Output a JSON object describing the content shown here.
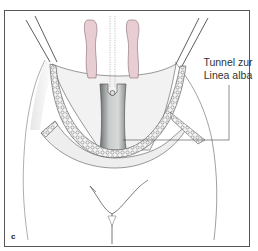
{
  "figure": {
    "panel_letter": "c",
    "callout": {
      "line1": "Tunnel zur",
      "line2": "Linea alba"
    }
  },
  "colors": {
    "frame": "#555555",
    "muscle_pink": "#e8cdd3",
    "muscle_outline": "#8a6a72",
    "tunnel_gray": "#b8bcbc",
    "skin_shade": "#e6e6e6",
    "line": "#444444"
  }
}
